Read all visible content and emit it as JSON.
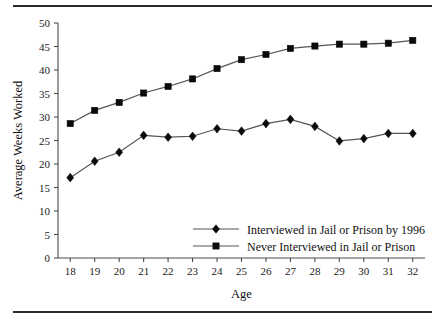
{
  "figure": {
    "has_top_rule": true,
    "has_bottom_rule": true
  },
  "chart_data": {
    "type": "line",
    "title": "",
    "xlabel": "Age",
    "ylabel": "Average Weeks Worked",
    "x": [
      18,
      19,
      20,
      21,
      22,
      23,
      24,
      25,
      26,
      27,
      28,
      29,
      30,
      31,
      32
    ],
    "categories": [
      "18",
      "19",
      "20",
      "21",
      "22",
      "23",
      "24",
      "25",
      "26",
      "27",
      "28",
      "29",
      "30",
      "31",
      "32"
    ],
    "xlim": [
      17.5,
      32.5
    ],
    "ylim": [
      0,
      50
    ],
    "yticks": [
      0,
      5,
      10,
      15,
      20,
      25,
      30,
      35,
      40,
      45,
      50
    ],
    "ytick_labels": [
      "0",
      "5",
      "10",
      "15",
      "20",
      "25",
      "30",
      "35",
      "40",
      "45",
      "50"
    ],
    "grid": false,
    "legend_position": "center-right-inside",
    "series": [
      {
        "name": "Interviewed in Jail or Prison by 1996",
        "marker": "diamond",
        "color": "#0b0b0b",
        "values": [
          17.1,
          20.6,
          22.5,
          26.1,
          25.7,
          25.9,
          27.5,
          27.0,
          28.6,
          29.5,
          28.0,
          24.9,
          25.4,
          26.5,
          26.5
        ]
      },
      {
        "name": "Never Interviewed in Jail or Prison",
        "marker": "square",
        "color": "#0b0b0b",
        "values": [
          28.6,
          31.4,
          33.1,
          35.1,
          36.5,
          38.1,
          40.3,
          42.2,
          43.3,
          44.6,
          45.1,
          45.5,
          45.5,
          45.7,
          46.3
        ]
      }
    ]
  }
}
